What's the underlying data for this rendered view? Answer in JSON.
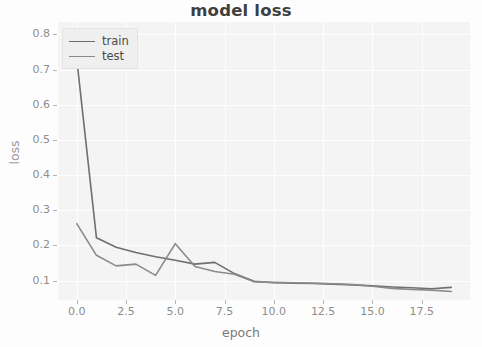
{
  "chart_data": {
    "type": "line",
    "title": "model loss",
    "xlabel": "epoch",
    "ylabel": "loss",
    "xlim": [
      -0.95,
      19.95
    ],
    "ylim": [
      0.045,
      0.835
    ],
    "xticks": [
      "0.0",
      "2.5",
      "5.0",
      "7.5",
      "10.0",
      "12.5",
      "15.0",
      "17.5"
    ],
    "xtick_values": [
      0.0,
      2.5,
      5.0,
      7.5,
      10.0,
      12.5,
      15.0,
      17.5
    ],
    "yticks": [
      "0.1",
      "0.2",
      "0.3",
      "0.4",
      "0.5",
      "0.6",
      "0.7",
      "0.8"
    ],
    "ytick_values": [
      0.1,
      0.2,
      0.3,
      0.4,
      0.5,
      0.6,
      0.7,
      0.8
    ],
    "grid": true,
    "legend_position": "upper left",
    "x": [
      0,
      1,
      2,
      3,
      4,
      5,
      6,
      7,
      8,
      9,
      10,
      11,
      12,
      13,
      14,
      15,
      16,
      17,
      18,
      19
    ],
    "series": [
      {
        "name": "train",
        "color": "#6f6f6f",
        "values": [
          0.73,
          0.222,
          0.195,
          0.18,
          0.168,
          0.158,
          0.147,
          0.152,
          0.12,
          0.098,
          0.094,
          0.093,
          0.092,
          0.09,
          0.088,
          0.085,
          0.082,
          0.08,
          0.077,
          0.081
        ]
      },
      {
        "name": "test",
        "color": "#8a8a8a",
        "values": [
          0.262,
          0.172,
          0.142,
          0.147,
          0.115,
          0.205,
          0.14,
          0.126,
          0.118,
          0.097,
          0.095,
          0.094,
          0.093,
          0.091,
          0.089,
          0.084,
          0.078,
          0.075,
          0.073,
          0.069
        ]
      }
    ]
  },
  "legend": {
    "items": [
      {
        "label": "train"
      },
      {
        "label": "test"
      }
    ]
  }
}
